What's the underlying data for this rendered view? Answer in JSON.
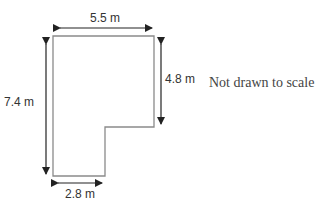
{
  "diagram": {
    "type": "floor-plan",
    "shape": "L-shape",
    "dimensions": {
      "top_width": "5.5 m",
      "left_height": "7.4 m",
      "right_height": "4.8 m",
      "bottom_width": "2.8 m"
    },
    "note": "Not drawn to scale",
    "colors": {
      "outline": "#8a8a8a",
      "arrow": "#222222",
      "text": "#333333"
    }
  }
}
